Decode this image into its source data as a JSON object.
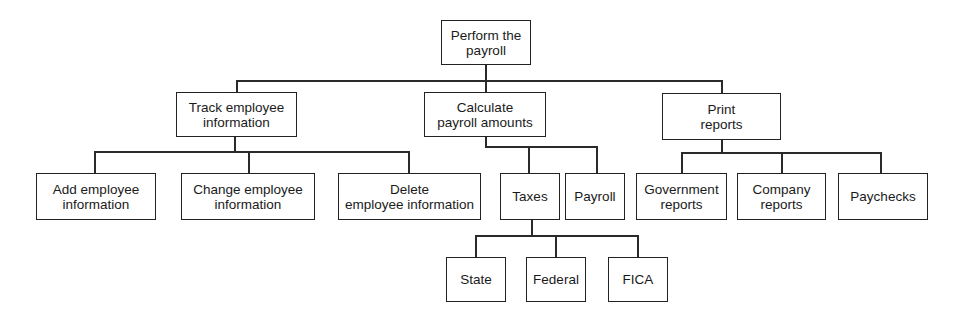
{
  "diagram": {
    "type": "hierarchy chart",
    "nodes": {
      "root": "Perform the\npayroll",
      "track": "Track employee\ninformation",
      "calculate": "Calculate\npayroll amounts",
      "print": "Print\nreports",
      "add": "Add employee\ninformation",
      "change": "Change employee\ninformation",
      "delete": "Delete\nemployee information",
      "taxes": "Taxes",
      "payroll": "Payroll",
      "government": "Government\nreports",
      "company": "Company\nreports",
      "paychecks": "Paychecks",
      "state": "State",
      "federal": "Federal",
      "fica": "FICA"
    },
    "edges": [
      [
        "root",
        "track"
      ],
      [
        "root",
        "calculate"
      ],
      [
        "root",
        "print"
      ],
      [
        "track",
        "add"
      ],
      [
        "track",
        "change"
      ],
      [
        "track",
        "delete"
      ],
      [
        "calculate",
        "taxes"
      ],
      [
        "calculate",
        "payroll"
      ],
      [
        "print",
        "government"
      ],
      [
        "print",
        "company"
      ],
      [
        "print",
        "paychecks"
      ],
      [
        "taxes",
        "state"
      ],
      [
        "taxes",
        "federal"
      ],
      [
        "taxes",
        "fica"
      ]
    ]
  }
}
